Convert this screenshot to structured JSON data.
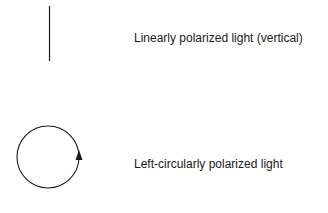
{
  "diagram": {
    "items": [
      {
        "symbol": "vertical-line",
        "label": "Linearly polarized light (vertical)"
      },
      {
        "symbol": "circle-with-arrow-up-right-side",
        "label": "Left-circularly polarized light"
      }
    ],
    "colors": {
      "stroke": "#1a1a1a",
      "background": "#ffffff"
    }
  }
}
